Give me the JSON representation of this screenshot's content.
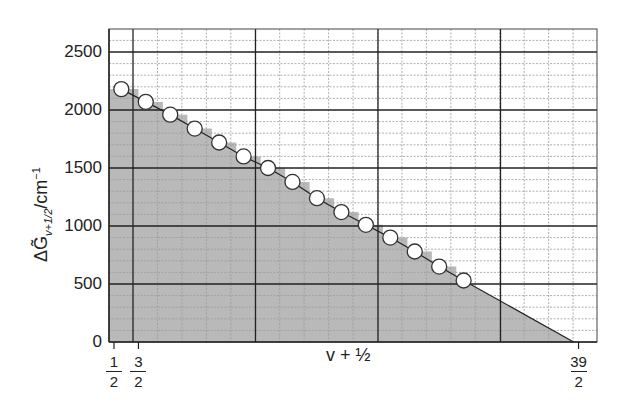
{
  "chart_data": {
    "type": "scatter",
    "title": "",
    "xlabel": "v + ½",
    "ylabel": "ΔG̃v+1/2/cm⁻¹",
    "ylabel_parts": {
      "symbol": "ΔG̃",
      "subscript": "v+1/2",
      "unit": "/cm",
      "unit_exp": "−1"
    },
    "xlim": [
      0.2,
      20.1
    ],
    "ylim": [
      0,
      2700
    ],
    "x_ticks": [
      {
        "value": 0.5,
        "num": "1",
        "den": "2"
      },
      {
        "value": 1.5,
        "num": "3",
        "den": "2"
      },
      {
        "value": 19.5,
        "num": "39",
        "den": "2"
      }
    ],
    "y_ticks": [
      "0",
      "500",
      "1000",
      "1500",
      "2000",
      "2500"
    ],
    "grid": true,
    "series": [
      {
        "name": "ΔG̃v+1/2",
        "x": [
          0.8,
          1.8,
          2.8,
          3.8,
          4.8,
          5.8,
          6.8,
          7.8,
          8.8,
          9.8,
          10.8,
          11.8,
          12.8,
          13.8,
          14.8
        ],
        "values": [
          2180,
          2070,
          1960,
          1840,
          1720,
          1600,
          1500,
          1380,
          1240,
          1120,
          1010,
          900,
          780,
          650,
          530
        ]
      }
    ],
    "extrapolation": {
      "from": [
        14.8,
        530
      ],
      "to": [
        19.3,
        0
      ]
    },
    "shaded_area": "stepped area under points plus linear extrapolation to zero",
    "colors": {
      "shade": "#b9b9b9",
      "grid_major": "#222222",
      "grid_minor": "#9a9a9a",
      "marker_fill": "#ffffff",
      "marker_edge": "#333333"
    }
  }
}
